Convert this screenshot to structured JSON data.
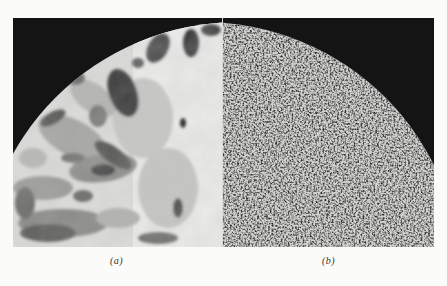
{
  "figure": {
    "panels": [
      {
        "id": "a",
        "label": "(a)",
        "description": "Micrograph of circular specimen showing large coarse grains with varied gray tones; dark background at top-left beyond curved specimen edge"
      },
      {
        "id": "b",
        "label": "(b)",
        "description": "Micrograph of circular specimen showing fine uniform granular (speckled) texture; dark background at top-right beyond curved specimen edge"
      }
    ],
    "colors": {
      "page_background": "#fbfbfa",
      "dark_background": "#141414",
      "grain_light": "#e6e6e4",
      "grain_mid": "#9a9a98",
      "grain_dark": "#3a3a3a"
    }
  }
}
